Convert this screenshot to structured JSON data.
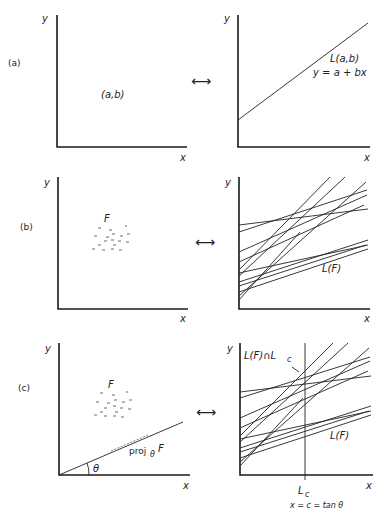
{
  "figure": {
    "rows": [
      {
        "label": "(a)",
        "left": {
          "axis_x": "x",
          "axis_y": "y",
          "point_label": "(a,b)"
        },
        "arrow": "⟷",
        "right": {
          "axis_x": "x",
          "axis_y": "y",
          "line_label": "L(a,b)",
          "equation": "y = a + bx"
        }
      },
      {
        "label": "(b)",
        "left": {
          "axis_x": "x",
          "axis_y": "y",
          "set_label": "F"
        },
        "arrow": "⟷",
        "right": {
          "axis_x": "x",
          "axis_y": "y",
          "lines_label": "L(F)"
        }
      },
      {
        "label": "(c)",
        "left": {
          "axis_x": "x",
          "axis_y": "y",
          "set_label": "F",
          "proj_label": "proj",
          "proj_sub": "θ",
          "proj_F": "F",
          "angle_label": "θ"
        },
        "arrow": "⟷",
        "right": {
          "axis_x": "x",
          "axis_y": "y",
          "intersection_label": "L(F)∩L",
          "intersection_sub": "c",
          "lines_label": "L(F)",
          "vline_label": "L",
          "vline_sub": "c",
          "vline_eq": "x = c = tan θ"
        }
      }
    ]
  }
}
